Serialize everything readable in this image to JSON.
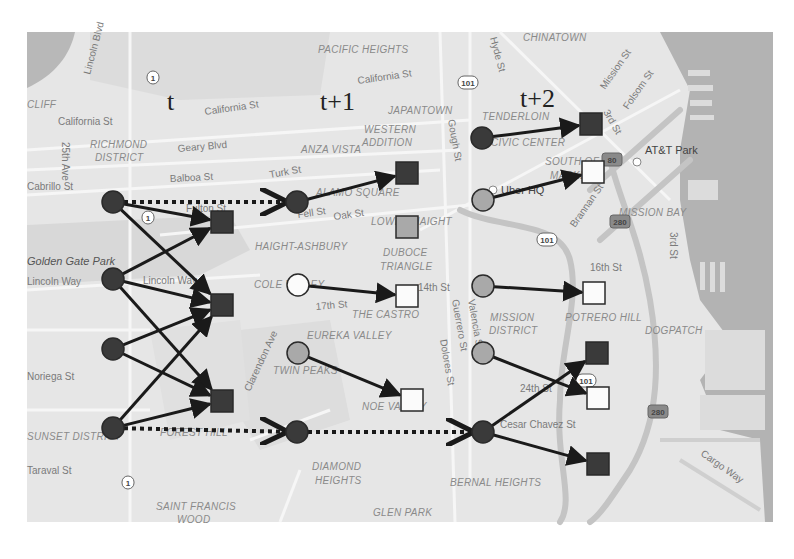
{
  "figure": {
    "time_labels": [
      {
        "id": "t",
        "text": "t",
        "x": 167,
        "y": 110
      },
      {
        "id": "t1",
        "text": "t+1",
        "x": 320,
        "y": 110
      },
      {
        "id": "t2",
        "text": "t+2",
        "x": 520,
        "y": 107
      }
    ],
    "colors": {
      "map_bg": "#e8e8e8",
      "water": "#b4b4b4",
      "road": "#f7f7f7",
      "highway": "#c9c9c9",
      "node_dark": "#3a3a3a",
      "node_grey": "#a9a9a9",
      "node_white": "#fbfbfb",
      "edge": "#1a1a1a",
      "node_stroke": "#2a2a2a"
    }
  },
  "map_labels": {
    "districts": [
      {
        "text": "PACIFIC HEIGHTS",
        "x": 318,
        "y": 53
      },
      {
        "text": "CHINATOWN",
        "x": 523,
        "y": 41
      },
      {
        "text": "CLIFF",
        "x": 27,
        "y": 108
      },
      {
        "text": "RICHMOND",
        "x": 90,
        "y": 148
      },
      {
        "text": "DISTRICT",
        "x": 95,
        "y": 161
      },
      {
        "text": "JAPANTOWN",
        "x": 388,
        "y": 114
      },
      {
        "text": "WESTERN",
        "x": 364,
        "y": 133
      },
      {
        "text": "ADDITION",
        "x": 362,
        "y": 146
      },
      {
        "text": "ANZA VISTA",
        "x": 301,
        "y": 153
      },
      {
        "text": "TENDERLOIN",
        "x": 482,
        "y": 120
      },
      {
        "text": "CIVIC CENTER",
        "x": 491,
        "y": 146
      },
      {
        "text": "SOUTH OF",
        "x": 545,
        "y": 165
      },
      {
        "text": "MARKET",
        "x": 550,
        "y": 179
      },
      {
        "text": "ALAMO SQUARE",
        "x": 316,
        "y": 196
      },
      {
        "text": "LOWER HAIGHT",
        "x": 371,
        "y": 225
      },
      {
        "text": "HAIGHT-ASHBURY",
        "x": 255,
        "y": 250
      },
      {
        "text": "DUBOCE",
        "x": 383,
        "y": 256
      },
      {
        "text": "TRIANGLE",
        "x": 380,
        "y": 270
      },
      {
        "text": "MISSION BAY",
        "x": 619,
        "y": 216
      },
      {
        "text": "COLE VALLEY",
        "x": 254,
        "y": 288
      },
      {
        "text": "THE CASTRO",
        "x": 352,
        "y": 318
      },
      {
        "text": "MISSION",
        "x": 490,
        "y": 321
      },
      {
        "text": "DISTRICT",
        "x": 489,
        "y": 334
      },
      {
        "text": "POTRERO HILL",
        "x": 565,
        "y": 321
      },
      {
        "text": "DOGPATCH",
        "x": 645,
        "y": 334
      },
      {
        "text": "EUREKA VALLEY",
        "x": 307,
        "y": 339
      },
      {
        "text": "TWIN PEAKS",
        "x": 273,
        "y": 374
      },
      {
        "text": "NOE VALLEY",
        "x": 362,
        "y": 410
      },
      {
        "text": "FOREST HILL",
        "x": 160,
        "y": 436
      },
      {
        "text": "SUNSET DISTRICT",
        "x": 27,
        "y": 440
      },
      {
        "text": "DIAMOND",
        "x": 312,
        "y": 470
      },
      {
        "text": "HEIGHTS",
        "x": 315,
        "y": 484
      },
      {
        "text": "BERNAL HEIGHTS",
        "x": 450,
        "y": 486
      },
      {
        "text": "SAINT FRANCIS",
        "x": 156,
        "y": 510
      },
      {
        "text": "WOOD",
        "x": 177,
        "y": 523
      },
      {
        "text": "GLEN PARK",
        "x": 373,
        "y": 516
      }
    ],
    "streets": [
      {
        "text": "Lincoln Blvd",
        "x": 90,
        "y": 75,
        "rotate": -75
      },
      {
        "text": "California St",
        "x": 205,
        "y": 115,
        "rotate": -8
      },
      {
        "text": "California St",
        "x": 58,
        "y": 125,
        "rotate": 0
      },
      {
        "text": "California St",
        "x": 358,
        "y": 84,
        "rotate": -8
      },
      {
        "text": "Geary Blvd",
        "x": 178,
        "y": 152,
        "rotate": -5
      },
      {
        "text": "25th Ave",
        "x": 62,
        "y": 142,
        "rotate": 90
      },
      {
        "text": "Balboa St",
        "x": 170,
        "y": 182,
        "rotate": -3
      },
      {
        "text": "Turk St",
        "x": 270,
        "y": 178,
        "rotate": -10
      },
      {
        "text": "Fulton St",
        "x": 186,
        "y": 212,
        "rotate": 0
      },
      {
        "text": "Fell St",
        "x": 298,
        "y": 218,
        "rotate": -8
      },
      {
        "text": "Oak St",
        "x": 334,
        "y": 220,
        "rotate": -8
      },
      {
        "text": "Hyde St",
        "x": 490,
        "y": 38,
        "rotate": 75
      },
      {
        "text": "Mission St",
        "x": 605,
        "y": 90,
        "rotate": -55
      },
      {
        "text": "Folsom St",
        "x": 628,
        "y": 110,
        "rotate": -55
      },
      {
        "text": "3rd St",
        "x": 603,
        "y": 112,
        "rotate": 60
      },
      {
        "text": "Gough St",
        "x": 448,
        "y": 120,
        "rotate": 80
      },
      {
        "text": "Brannan St",
        "x": 575,
        "y": 228,
        "rotate": -55
      },
      {
        "text": "3rd St",
        "x": 670,
        "y": 232,
        "rotate": 90
      },
      {
        "text": "16th St",
        "x": 590,
        "y": 271,
        "rotate": 0
      },
      {
        "text": "14th St",
        "x": 418,
        "y": 291,
        "rotate": 0
      },
      {
        "text": "17th St",
        "x": 316,
        "y": 310,
        "rotate": -5
      },
      {
        "text": "Lincoln Way",
        "x": 143,
        "y": 284,
        "rotate": 0
      },
      {
        "text": "Clarendon Ave",
        "x": 250,
        "y": 392,
        "rotate": -65
      },
      {
        "text": "Valencia St",
        "x": 468,
        "y": 300,
        "rotate": 80
      },
      {
        "text": "Guerrero St",
        "x": 452,
        "y": 300,
        "rotate": 80
      },
      {
        "text": "Dolores St",
        "x": 440,
        "y": 340,
        "rotate": 80
      },
      {
        "text": "24th St",
        "x": 520,
        "y": 392,
        "rotate": 0
      },
      {
        "text": "Cesar Chavez St",
        "x": 500,
        "y": 428,
        "rotate": 0
      },
      {
        "text": "Cargo Way",
        "x": 700,
        "y": 455,
        "rotate": 35
      },
      {
        "text": "Noriega St",
        "x": 27,
        "y": 380,
        "rotate": 0
      },
      {
        "text": "Taraval St",
        "x": 27,
        "y": 474,
        "rotate": 0
      },
      {
        "text": "Lincoln Way",
        "x": 27,
        "y": 285,
        "rotate": 0
      },
      {
        "text": "Cabrillo St",
        "x": 27,
        "y": 190,
        "rotate": 0
      }
    ],
    "pois": [
      {
        "text": "AT&T Park",
        "x": 645,
        "y": 154
      },
      {
        "text": "Uber HQ",
        "x": 501,
        "y": 194
      },
      {
        "text": "Golden Gate Park",
        "x": 27,
        "y": 265
      }
    ],
    "shields": [
      {
        "text": "1",
        "x": 153,
        "y": 78
      },
      {
        "text": "1",
        "x": 148,
        "y": 218
      },
      {
        "text": "1",
        "x": 128,
        "y": 483
      },
      {
        "text": "101",
        "x": 468,
        "y": 83
      },
      {
        "text": "101",
        "x": 547,
        "y": 240
      },
      {
        "text": "101",
        "x": 586,
        "y": 381
      },
      {
        "text": "280",
        "x": 620,
        "y": 222
      },
      {
        "text": "280",
        "x": 658,
        "y": 412
      },
      {
        "text": "80",
        "x": 612,
        "y": 160
      }
    ]
  },
  "graph": {
    "nodes": [
      {
        "id": "t_c1",
        "shape": "circle",
        "shade": "dark",
        "x": 113,
        "y": 202
      },
      {
        "id": "t_c2",
        "shape": "circle",
        "shade": "dark",
        "x": 113,
        "y": 279
      },
      {
        "id": "t_c3",
        "shape": "circle",
        "shade": "dark",
        "x": 113,
        "y": 349
      },
      {
        "id": "t_c4",
        "shape": "circle",
        "shade": "dark",
        "x": 113,
        "y": 428
      },
      {
        "id": "t_s1",
        "shape": "square",
        "shade": "dark",
        "x": 222,
        "y": 222
      },
      {
        "id": "t_s2",
        "shape": "square",
        "shade": "dark",
        "x": 222,
        "y": 305
      },
      {
        "id": "t_s3",
        "shape": "square",
        "shade": "dark",
        "x": 222,
        "y": 401
      },
      {
        "id": "t1_c1",
        "shape": "circle",
        "shade": "dark",
        "x": 297,
        "y": 202
      },
      {
        "id": "t1_c2",
        "shape": "circle",
        "shade": "white",
        "x": 298,
        "y": 285
      },
      {
        "id": "t1_c3",
        "shape": "circle",
        "shade": "grey",
        "x": 298,
        "y": 353
      },
      {
        "id": "t1_c4",
        "shape": "circle",
        "shade": "dark",
        "x": 297,
        "y": 432
      },
      {
        "id": "t1_s1",
        "shape": "square",
        "shade": "dark",
        "x": 407,
        "y": 173
      },
      {
        "id": "t1_s2",
        "shape": "square",
        "shade": "grey",
        "x": 407,
        "y": 227
      },
      {
        "id": "t1_s3",
        "shape": "square",
        "shade": "white",
        "x": 407,
        "y": 296
      },
      {
        "id": "t1_s4",
        "shape": "square",
        "shade": "white",
        "x": 412,
        "y": 400
      },
      {
        "id": "t2_c1",
        "shape": "circle",
        "shade": "dark",
        "x": 482,
        "y": 138
      },
      {
        "id": "t2_c2",
        "shape": "circle",
        "shade": "grey",
        "x": 483,
        "y": 200
      },
      {
        "id": "t2_c3",
        "shape": "circle",
        "shade": "grey",
        "x": 483,
        "y": 286
      },
      {
        "id": "t2_c4",
        "shape": "circle",
        "shade": "grey",
        "x": 483,
        "y": 353
      },
      {
        "id": "t2_c5",
        "shape": "circle",
        "shade": "dark",
        "x": 483,
        "y": 432
      },
      {
        "id": "t2_s1",
        "shape": "square",
        "shade": "dark",
        "x": 591,
        "y": 124
      },
      {
        "id": "t2_s2",
        "shape": "square",
        "shade": "white",
        "x": 593,
        "y": 172
      },
      {
        "id": "t2_s3",
        "shape": "square",
        "shade": "white",
        "x": 594,
        "y": 293
      },
      {
        "id": "t2_s4",
        "shape": "square",
        "shade": "dark",
        "x": 597,
        "y": 353
      },
      {
        "id": "t2_s5",
        "shape": "square",
        "shade": "white",
        "x": 598,
        "y": 398
      },
      {
        "id": "t2_s6",
        "shape": "square",
        "shade": "dark",
        "x": 598,
        "y": 464
      }
    ],
    "edges": [
      {
        "from": "t_c1",
        "to": "t_s1",
        "style": "solid"
      },
      {
        "from": "t_c1",
        "to": "t_s2",
        "style": "solid"
      },
      {
        "from": "t_c2",
        "to": "t_s1",
        "style": "solid"
      },
      {
        "from": "t_c2",
        "to": "t_s2",
        "style": "solid"
      },
      {
        "from": "t_c2",
        "to": "t_s3",
        "style": "solid"
      },
      {
        "from": "t_c3",
        "to": "t_s2",
        "style": "solid"
      },
      {
        "from": "t_c3",
        "to": "t_s3",
        "style": "solid"
      },
      {
        "from": "t_c4",
        "to": "t_s2",
        "style": "solid"
      },
      {
        "from": "t_c4",
        "to": "t_s3",
        "style": "solid"
      },
      {
        "from": "t_c1",
        "to": "t1_c1",
        "style": "dotted"
      },
      {
        "from": "t_c4",
        "to": "t1_c4",
        "style": "dotted"
      },
      {
        "from": "t1_c1",
        "to": "t1_s1",
        "style": "solid"
      },
      {
        "from": "t1_c2",
        "to": "t1_s3",
        "style": "solid"
      },
      {
        "from": "t1_c3",
        "to": "t1_s4",
        "style": "solid"
      },
      {
        "from": "t1_c4",
        "to": "t2_c5",
        "style": "dotted"
      },
      {
        "from": "t2_c1",
        "to": "t2_s1",
        "style": "solid"
      },
      {
        "from": "t2_c2",
        "to": "t2_s2",
        "style": "solid"
      },
      {
        "from": "t2_c3",
        "to": "t2_s3",
        "style": "solid"
      },
      {
        "from": "t2_c4",
        "to": "t2_s5",
        "style": "solid"
      },
      {
        "from": "t2_c5",
        "to": "t2_s4",
        "style": "solid"
      },
      {
        "from": "t2_c5",
        "to": "t2_s6",
        "style": "solid"
      }
    ]
  }
}
